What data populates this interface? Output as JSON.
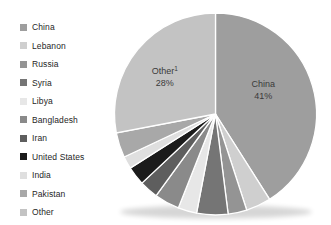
{
  "chart_data": {
    "type": "pie",
    "title": "",
    "legend_position": "left",
    "start_angle_deg": 0,
    "direction": "clockwise",
    "stroke_color": "#ffffff",
    "background": "#ffffff",
    "series": [
      {
        "label": "China",
        "value": 41,
        "color": "#9e9e9e"
      },
      {
        "label": "Lebanon",
        "value": 4,
        "color": "#cfcfcf"
      },
      {
        "label": "Russia",
        "value": 3,
        "color": "#949494"
      },
      {
        "label": "Syria",
        "value": 5,
        "color": "#757575"
      },
      {
        "label": "Libya",
        "value": 3,
        "color": "#e7e7e7"
      },
      {
        "label": "Bangladesh",
        "value": 4,
        "color": "#8a8a8a"
      },
      {
        "label": "Iran",
        "value": 3,
        "color": "#5e5e5e"
      },
      {
        "label": "United States",
        "value": 3,
        "color": "#1b1b1b"
      },
      {
        "label": "India",
        "value": 2,
        "color": "#dfdfdf"
      },
      {
        "label": "Pakistan",
        "value": 4,
        "color": "#a8a8a8"
      },
      {
        "label": "Other",
        "value": 28,
        "color": "#c3c3c3"
      }
    ],
    "data_labels": [
      {
        "series": "China",
        "line1": "China",
        "superscript": "",
        "line2": "41%"
      },
      {
        "series": "Other",
        "line1": "Other",
        "superscript": "1",
        "line2": "28%"
      }
    ],
    "shown_values_note": "Only China (41%) and Other (28%) percentages are displayed on the chart; remaining slice values are estimated from slice angles."
  }
}
